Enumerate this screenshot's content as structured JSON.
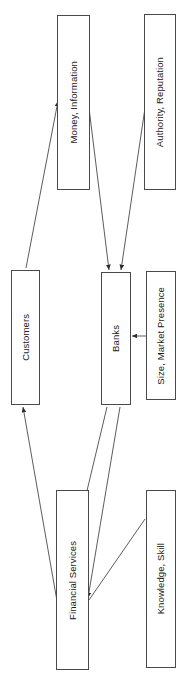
{
  "diagram": {
    "orientation": "rotated-90",
    "background_color": "#ffffff",
    "line_color": "#4a4a4a",
    "nodes": [
      {
        "id": "money-information",
        "label": "Money, Information",
        "x": 57,
        "y": 15,
        "w": 33,
        "h": 175
      },
      {
        "id": "authority-reputation",
        "label": "Authority, Reputation",
        "x": 144,
        "y": 14,
        "w": 32,
        "h": 176
      },
      {
        "id": "customers",
        "label": "Customers",
        "x": 11,
        "y": 270,
        "w": 29,
        "h": 135
      },
      {
        "id": "banks",
        "label": "Banks",
        "x": 101,
        "y": 272,
        "w": 30,
        "h": 133
      },
      {
        "id": "size-market-presence",
        "label": "Size, Market Presence",
        "x": 146,
        "y": 271,
        "w": 30,
        "h": 129
      },
      {
        "id": "financial-services",
        "label": "Financial Services",
        "x": 56,
        "y": 490,
        "w": 33,
        "h": 180
      },
      {
        "id": "knowledge-skill",
        "label": "Knowledge, Skill",
        "x": 146,
        "y": 490,
        "w": 30,
        "h": 178
      }
    ],
    "edges": [
      {
        "id": "customers-to-money-information",
        "from": "customers",
        "to": "money-information",
        "x1": 26,
        "y1": 268,
        "x2": 58,
        "y2": 101,
        "arrow": "end"
      },
      {
        "id": "money-information-to-banks",
        "from": "money-information",
        "to": "banks",
        "x1": 89,
        "y1": 108,
        "x2": 109,
        "y2": 270,
        "arrow": "end"
      },
      {
        "id": "authority-reputation-to-banks",
        "from": "authority-reputation",
        "to": "banks",
        "x1": 145,
        "y1": 108,
        "x2": 121,
        "y2": 270,
        "arrow": "end"
      },
      {
        "id": "size-market-presence-to-banks",
        "from": "size-market-presence",
        "to": "banks",
        "x1": 146,
        "y1": 336,
        "x2": 132,
        "y2": 336,
        "arrow": "end"
      },
      {
        "id": "financial-services-to-customers",
        "from": "financial-services",
        "to": "customers",
        "x1": 57,
        "y1": 601,
        "x2": 23,
        "y2": 407,
        "arrow": "end"
      },
      {
        "id": "financial-services-to-banks",
        "from": "financial-services",
        "to": "banks",
        "x1": 80,
        "y1": 520,
        "x2": 107,
        "y2": 407,
        "arrow": "none"
      },
      {
        "id": "banks-to-financial-services",
        "from": "banks",
        "to": "financial-services",
        "x1": 120,
        "y1": 407,
        "x2": 88,
        "y2": 598,
        "arrow": "end"
      },
      {
        "id": "knowledge-skill-to-financial-services",
        "from": "knowledge-skill",
        "to": "financial-services",
        "x1": 145,
        "y1": 519,
        "x2": 89,
        "y2": 600,
        "arrow": "none"
      }
    ]
  }
}
